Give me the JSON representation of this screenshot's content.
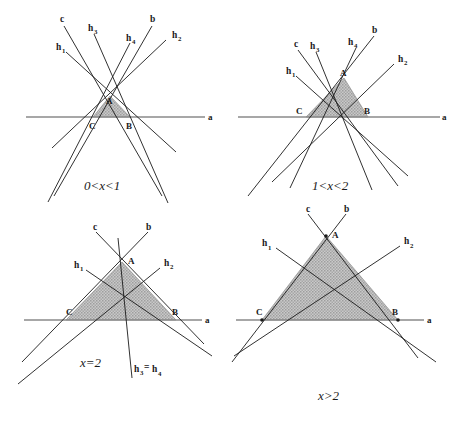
{
  "figure": {
    "background_color": "#ffffff",
    "line_color": "#1a1a1a",
    "axis_color": "#6e6e6e",
    "shade_color": "#b4b4b4",
    "shade_edge_color": "#8c8c8c"
  },
  "panels": [
    {
      "id": "panel-top-left",
      "caption": "0<x<1",
      "axis_label": "a",
      "vertices": {
        "A": "A",
        "B": "B",
        "C": "C"
      },
      "line_labels": {
        "c": "c",
        "b": "b",
        "h1_base": "h",
        "h1_sub": "1",
        "h2_base": "h",
        "h2_sub": "2",
        "h3_base": "h",
        "h3_sub": "3",
        "h4_base": "h",
        "h4_sub": "4"
      }
    },
    {
      "id": "panel-top-right",
      "caption": "1<x<2",
      "axis_label": "a",
      "vertices": {
        "A": "A",
        "B": "B",
        "C": "C"
      },
      "line_labels": {
        "c": "c",
        "b": "b",
        "h1_base": "h",
        "h1_sub": "1",
        "h2_base": "h",
        "h2_sub": "2",
        "h3_base": "h",
        "h3_sub": "3",
        "h4_base": "h",
        "h4_sub": "4"
      }
    },
    {
      "id": "panel-bottom-left",
      "caption": "x=2",
      "axis_label": "a",
      "vertices": {
        "A": "A",
        "B": "B",
        "C": "C"
      },
      "line_labels": {
        "c": "c",
        "b": "b",
        "h1_base": "h",
        "h1_sub": "1",
        "h2_base": "h",
        "h2_sub": "2",
        "h34_base1": "h",
        "h34_sub1": "3",
        "h34_eq": "=",
        "h34_base2": "h",
        "h34_sub2": "4"
      }
    },
    {
      "id": "panel-bottom-right",
      "caption": "x>2",
      "axis_label": "a",
      "vertices": {
        "A": "A",
        "B": "B",
        "C": "C"
      },
      "line_labels": {
        "c": "c",
        "b": "b",
        "h1_base": "h",
        "h1_sub": "1",
        "h2_base": "h",
        "h2_sub": "2"
      }
    }
  ]
}
